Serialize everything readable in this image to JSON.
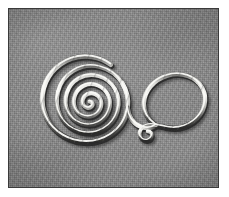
{
  "frame": {
    "border_color": "#ffffff",
    "border_width_px": 9,
    "plate_outline_color": "#3a3a3a"
  },
  "photo": {
    "alt_text": "Metal wire spiral and hook ornament on gray textile background",
    "background_color": "#8b8b8b",
    "width_px": 209,
    "height_px": 178,
    "tone": "grayscale",
    "texture": "fine woven grain"
  },
  "artifact": {
    "name": "spiral-hook-ornament",
    "description": "Flat coiled wire spiral joined to a large open hook terminating in a small curl",
    "material_color_highlight": "#f4f4f2",
    "material_color_midtone": "#b9b9b6",
    "material_color_shadow": "#2e2e2e",
    "parts": [
      {
        "id": "spiral",
        "label": "Flat spiral coil",
        "turns": 3
      },
      {
        "id": "connector",
        "label": "Connecting bend"
      },
      {
        "id": "hook",
        "label": "Open hook loop"
      },
      {
        "id": "terminal-curl",
        "label": "Terminal curl"
      }
    ]
  },
  "caption": {
    "text": ""
  }
}
